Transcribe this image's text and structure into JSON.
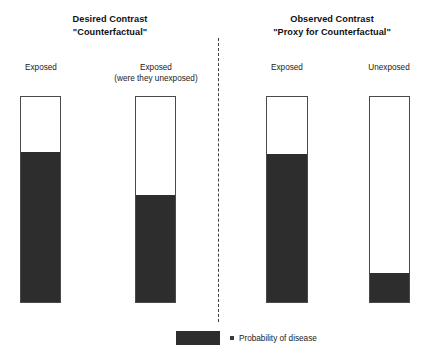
{
  "figure": {
    "type": "diagram",
    "background_color": "#ffffff",
    "fill_color": "#2d2d2d",
    "outline_color": "#4a4a4a"
  },
  "panels": [
    {
      "id": "desired",
      "title_line1": "Desired Contrast",
      "title_line2": "\"Counterfactual\"",
      "bars": [
        {
          "id": "exposed",
          "label_line1": "Exposed",
          "label_line2": "",
          "left": 20,
          "top": 96,
          "width": 41,
          "height": 207,
          "fill_fraction": 0.73
        },
        {
          "id": "exposed-counterfactual",
          "label_line1": "Exposed",
          "label_line2": "(were they unexposed)",
          "left": 135,
          "top": 96,
          "width": 41,
          "height": 207,
          "fill_fraction": 0.52
        }
      ]
    },
    {
      "id": "observed",
      "title_line1": "Observed Contrast",
      "title_line2": "\"Proxy for Counterfactual\"",
      "bars": [
        {
          "id": "exposed-observed",
          "label_line1": "Exposed",
          "label_line2": "",
          "left": 266,
          "top": 96,
          "width": 42,
          "height": 207,
          "fill_fraction": 0.72
        },
        {
          "id": "unexposed-observed",
          "label_line1": "Unexposed",
          "label_line2": "",
          "left": 369,
          "top": 96,
          "width": 41,
          "height": 207,
          "fill_fraction": 0.14
        }
      ]
    }
  ],
  "legend": {
    "text": "Probability of disease"
  },
  "chart_data": {
    "type": "bar",
    "title": "",
    "categories": [
      "Exposed (desired)",
      "Exposed (were they unexposed)",
      "Exposed (observed)",
      "Unexposed (observed)"
    ],
    "values": [
      0.73,
      0.52,
      0.72,
      0.14
    ],
    "ylabel": "Probability of disease",
    "ylim": [
      0,
      1
    ],
    "grid": false,
    "legend": [
      "Probability of disease"
    ]
  }
}
